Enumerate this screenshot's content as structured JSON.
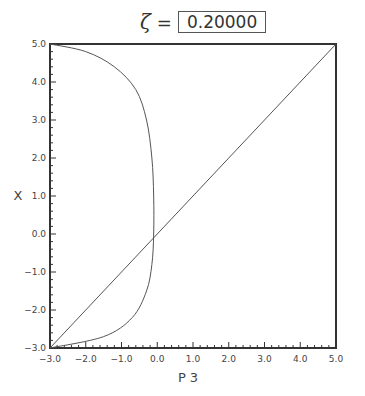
{
  "title": {
    "symbol": "ζ",
    "equals": "=",
    "value": "0.20000"
  },
  "chart_data": {
    "type": "line",
    "title": "ζ = 0.20000",
    "xlabel": "P 3",
    "ylabel": "X",
    "xlim": [
      -3.0,
      5.0
    ],
    "ylim": [
      -3.0,
      5.0
    ],
    "xticks": [
      "-3.0",
      "-2.0",
      "-1.0",
      "0.0",
      "1.0",
      "2.0",
      "3.0",
      "4.0",
      "5.0"
    ],
    "yticks": [
      "-3.0",
      "-2.0",
      "-1.0",
      "0.0",
      "1.0",
      "2.0",
      "3.0",
      "4.0",
      "5.0"
    ],
    "grid": false,
    "series": [
      {
        "name": "diagonal",
        "x": [
          -3.0,
          5.0
        ],
        "y": [
          -3.0,
          5.0
        ]
      },
      {
        "name": "curve",
        "x": [
          -3.0,
          -2.0,
          -1.2,
          -0.6,
          -0.3,
          -0.15,
          -0.1,
          -0.1,
          -0.15,
          -0.3,
          -0.7,
          -1.5,
          -3.0
        ],
        "y": [
          5.0,
          4.8,
          4.4,
          3.8,
          3.0,
          2.0,
          1.0,
          0.0,
          -0.8,
          -1.5,
          -2.2,
          -2.7,
          -3.0
        ]
      }
    ]
  }
}
